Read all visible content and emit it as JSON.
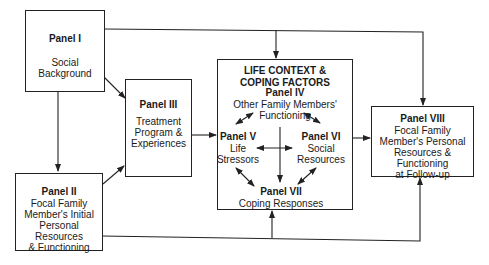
{
  "panels": {
    "p1": {
      "title": "Panel I",
      "lines": [
        "Social",
        "Background"
      ]
    },
    "p2": {
      "title": "Panel II",
      "lines": [
        "Focal Family",
        "Member's Initial",
        "Personal Resources",
        "& Functioning"
      ]
    },
    "p3": {
      "title": "Panel III",
      "lines": [
        "Treatment",
        "Program &",
        "Experiences"
      ]
    },
    "context": {
      "heading": [
        "LIFE CONTEXT &",
        "COPING FACTORS"
      ]
    },
    "p4": {
      "title": "Panel IV",
      "lines": [
        "Other Family Members'",
        "Functioning"
      ]
    },
    "p5": {
      "title": "Panel V",
      "lines": [
        "Life",
        "Stressors"
      ]
    },
    "p6": {
      "title": "Panel VI",
      "lines": [
        "Social",
        "Resources"
      ]
    },
    "p7": {
      "title": "Panel VII",
      "lines": [
        "Coping Responses"
      ]
    },
    "p8": {
      "title": "Panel VIII",
      "lines": [
        "Focal Family",
        "Member's Personal",
        "Resources & Functioning",
        "at Follow-up"
      ]
    }
  }
}
